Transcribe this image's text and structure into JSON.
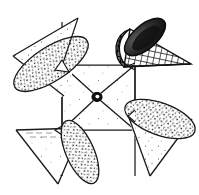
{
  "figure": {
    "title": "Pinwheel with four conical vanes",
    "kind": "line-drawing",
    "canvas": {
      "width": 199,
      "height": 195,
      "background": "#ffffff"
    },
    "stroke_color": "#1a1a1a",
    "fill_color": "#ffffff",
    "shade_color": "#2b2b2b"
  },
  "hub": {
    "label": "center-hub",
    "cx": 97,
    "cy": 97,
    "r_outer": 4.6,
    "r_inner": 2.0
  },
  "plate": {
    "label": "center-square-plate",
    "points": "62,65 135,65 135,130 62,130",
    "diagonals": [
      {
        "label": "diag-top-left",
        "x1": 62,
        "y1": 65,
        "x2": 93,
        "y2": 94
      },
      {
        "label": "diag-top-right",
        "x1": 135,
        "y1": 65,
        "x2": 101,
        "y2": 94
      },
      {
        "label": "diag-bottom-right",
        "x1": 135,
        "y1": 130,
        "x2": 101,
        "y2": 101
      },
      {
        "label": "diag-bottom-left",
        "x1": 62,
        "y1": 130,
        "x2": 93,
        "y2": 101
      }
    ]
  },
  "vanes": [
    {
      "name": "vane-upper-left",
      "texture": "stipple",
      "blade": "62,65 62,130 90,96",
      "spar": {
        "x1": 62,
        "y1": 60,
        "x2": 62,
        "y2": 130
      },
      "fold": "78,18 62,65 62,120",
      "cone": {
        "apex_x": 13,
        "apex_y": 56,
        "side_a": "13,56 78,18",
        "side_b": "13,56 62,95",
        "ellipse": {
          "cx": 50,
          "cy": 63,
          "rx": 42,
          "ry": 17,
          "rot": -33
        }
      }
    },
    {
      "name": "vane-upper-right",
      "texture": "crosshatch",
      "blade": "135,65 62,65 98,93",
      "spar": {
        "x1": 135,
        "y1": 65,
        "x2": 135,
        "y2": 128
      },
      "fold": "135,65 135,28",
      "cone": {
        "apex_x": 131,
        "apex_y": 30,
        "side_a": "131,30 190,64",
        "side_b": "131,30 126,64",
        "ellipse": {
          "cx": 146,
          "cy": 36,
          "rx": 24,
          "ry": 12,
          "rot": -42
        }
      }
    },
    {
      "name": "vane-lower-right",
      "texture": "stipple",
      "blade": "135,130 135,65 104,99",
      "spar": {
        "x1": 135,
        "y1": 130,
        "x2": 135,
        "y2": 175
      },
      "fold": "135,130 186,130",
      "cone": {
        "apex_x": 150,
        "apex_y": 175,
        "side_a": "150,175 191,118",
        "side_b": "150,175 131,114",
        "ellipse": {
          "cx": 160,
          "cy": 119,
          "rx": 37,
          "ry": 16,
          "rot": 22
        }
      }
    },
    {
      "name": "vane-lower-left",
      "texture": "stipple",
      "blade": "62,130 135,130 97,102",
      "spar": {
        "x1": 62,
        "y1": 130,
        "x2": 20,
        "y2": 130
      },
      "fold": "62,130 62,172",
      "cone": {
        "apex_x": 58,
        "apex_y": 183,
        "side_a": "58,183 17,130",
        "side_b": "58,183 76,128",
        "ellipse": {
          "cx": 47,
          "cy": 131,
          "rx": 34,
          "ry": 14,
          "rot": -4
        }
      }
    }
  ],
  "connector_lines": [
    {
      "name": "connector-top-left",
      "x1": 62,
      "y1": 65,
      "x2": 40,
      "y2": 62
    },
    {
      "name": "connector-top-right",
      "x1": 135,
      "y1": 65,
      "x2": 163,
      "y2": 65
    },
    {
      "name": "connector-right-lower",
      "x1": 135,
      "y1": 130,
      "x2": 163,
      "y2": 115
    },
    {
      "name": "connector-left-lower",
      "x1": 62,
      "y1": 130,
      "x2": 36,
      "y2": 130
    }
  ],
  "arrow_tips": [
    {
      "name": "arrow-tip-upper-left",
      "points": "62,62 56,70 68,72"
    },
    {
      "name": "arrow-tip-center",
      "points": "93,94 101,94 97,101"
    }
  ]
}
